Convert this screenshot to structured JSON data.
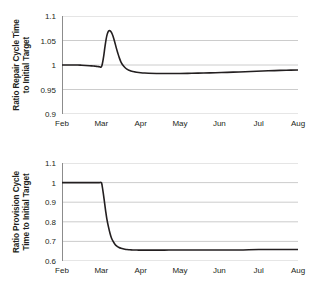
{
  "figure": {
    "background": "#ffffff",
    "line_color": "#231f20",
    "grid_color": "#bfbfbf",
    "axis_color": "#8c8c8c"
  },
  "chart_data": [
    {
      "type": "line",
      "title": "",
      "ylabel": "Ratio Repair Cycle Time\nto Initial Target",
      "xlabel": "",
      "ylim": [
        0.9,
        1.1
      ],
      "yticks": [
        "0.9",
        "0.95",
        "1",
        "1.05",
        "1.1"
      ],
      "ytick_values": [
        0.9,
        0.95,
        1.0,
        1.05,
        1.1
      ],
      "xticks": [
        "Feb",
        "Mar",
        "Apr",
        "May",
        "Jun",
        "Jul",
        "Aug"
      ],
      "xtick_values": [
        0,
        1,
        2,
        3,
        4,
        5,
        6
      ],
      "xlim": [
        0,
        6
      ],
      "grid": true,
      "legend": "none",
      "series": [
        {
          "name": "Ratio Repair Cycle Time to Initial Target",
          "x": [
            0.0,
            0.1,
            0.2,
            0.3,
            0.4,
            0.5,
            0.6,
            0.7,
            0.8,
            0.85,
            0.9,
            0.95,
            1.0,
            1.03,
            1.06,
            1.09,
            1.12,
            1.15,
            1.18,
            1.22,
            1.26,
            1.3,
            1.34,
            1.38,
            1.42,
            1.46,
            1.5,
            1.55,
            1.6,
            1.65,
            1.7,
            1.75,
            1.8,
            1.85,
            1.9,
            2.0,
            2.1,
            2.2,
            2.4,
            2.6,
            2.8,
            3.0,
            3.3,
            3.6,
            3.9,
            4.2,
            4.5,
            4.8,
            5.1,
            5.4,
            5.7,
            6.0
          ],
          "y": [
            1.0,
            1.0,
            1.0,
            1.0,
            1.0,
            0.9995,
            0.999,
            0.9985,
            0.998,
            0.9975,
            0.997,
            0.9965,
            0.996,
            1.004,
            1.018,
            1.036,
            1.052,
            1.063,
            1.069,
            1.07,
            1.066,
            1.058,
            1.047,
            1.035,
            1.024,
            1.014,
            1.006,
            0.9995,
            0.995,
            0.9915,
            0.9893,
            0.9878,
            0.9867,
            0.986,
            0.9853,
            0.9843,
            0.9836,
            0.9832,
            0.9828,
            0.9827,
            0.9827,
            0.9828,
            0.9831,
            0.9836,
            0.9843,
            0.985,
            0.9858,
            0.9867,
            0.9877,
            0.9886,
            0.9893,
            0.9899
          ]
        }
      ]
    },
    {
      "type": "line",
      "title": "",
      "ylabel": "Ratio Provision Cycle\nTime to Initial Target",
      "xlabel": "",
      "ylim": [
        0.6,
        1.1
      ],
      "yticks": [
        "0.6",
        "0.7",
        "0.8",
        "0.9",
        "1",
        "1.1"
      ],
      "ytick_values": [
        0.6,
        0.7,
        0.8,
        0.9,
        1.0,
        1.1
      ],
      "xticks": [
        "Feb",
        "Mar",
        "Apr",
        "May",
        "Jun",
        "Jul",
        "Aug"
      ],
      "xtick_values": [
        0,
        1,
        2,
        3,
        4,
        5,
        6
      ],
      "xlim": [
        0,
        6
      ],
      "grid": true,
      "legend": "none",
      "series": [
        {
          "name": "Ratio Provision Cycle Time to Initial Target",
          "x": [
            0.0,
            0.2,
            0.4,
            0.6,
            0.8,
            0.9,
            0.95,
            1.0,
            1.02,
            1.05,
            1.08,
            1.11,
            1.14,
            1.18,
            1.22,
            1.26,
            1.3,
            1.35,
            1.4,
            1.45,
            1.5,
            1.55,
            1.6,
            1.65,
            1.7,
            1.75,
            1.8,
            1.85,
            1.9,
            1.95,
            2.0,
            2.1,
            2.2,
            2.4,
            2.6,
            2.8,
            3.0,
            3.5,
            4.0,
            4.5,
            5.0,
            5.5,
            6.0
          ],
          "y": [
            1.0,
            1.0,
            1.0,
            1.0,
            1.0,
            1.0,
            1.0,
            1.0,
            0.985,
            0.945,
            0.9,
            0.855,
            0.815,
            0.775,
            0.742,
            0.716,
            0.7,
            0.684,
            0.675,
            0.669,
            0.665,
            0.662,
            0.66,
            0.6585,
            0.6575,
            0.657,
            0.6565,
            0.656,
            0.6558,
            0.6556,
            0.6555,
            0.6555,
            0.6555,
            0.6556,
            0.6557,
            0.6558,
            0.6558,
            0.656,
            0.656,
            0.6562,
            0.6585,
            0.6585,
            0.6585
          ]
        }
      ]
    }
  ]
}
